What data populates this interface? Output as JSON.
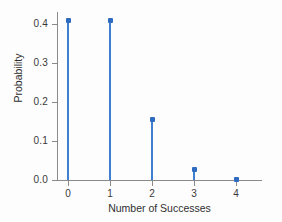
{
  "chart_data": {
    "type": "bar",
    "title": "",
    "subtitle": "",
    "xlabel": "Number of Successes",
    "ylabel": "Probability",
    "categories": [
      "0",
      "1",
      "2",
      "3",
      "4"
    ],
    "x": [
      0,
      1,
      2,
      3,
      4
    ],
    "values": [
      0.41,
      0.41,
      0.154,
      0.026,
      0.002
    ],
    "series": [
      {
        "name": "Probability",
        "values": [
          0.41,
          0.41,
          0.154,
          0.026,
          0.002
        ]
      }
    ],
    "xlim": [
      -0.35,
      4.6
    ],
    "ylim": [
      0.0,
      0.44
    ],
    "x_ticks": [
      "0",
      "1",
      "2",
      "3",
      "4"
    ],
    "y_ticks": [
      "0.0",
      "0.1",
      "0.2",
      "0.3",
      "0.4"
    ],
    "y_tick_values": [
      0.0,
      0.1,
      0.2,
      0.3,
      0.4
    ],
    "grid": false,
    "legend": "none",
    "marker_color": "#2f6cc0",
    "stem_color": "#3f7fd0",
    "axis_color": "#8a8a8a",
    "style": "stem-plot"
  },
  "axes": {
    "x_title": "Number of Successes",
    "y_title": "Probability"
  }
}
